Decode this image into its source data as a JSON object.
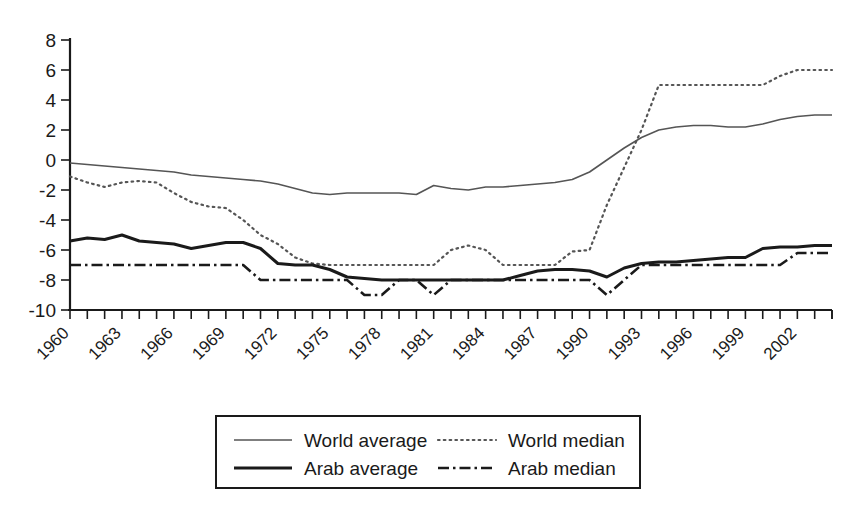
{
  "chart_data": {
    "type": "line",
    "title": "",
    "subtitle": "",
    "xlabel": "",
    "ylabel": "",
    "xlim": [
      1960,
      2004
    ],
    "ylim": [
      -10,
      8
    ],
    "ytick_step": 2,
    "grid": false,
    "legend_position": "bottom",
    "yticks": [
      "8",
      "6",
      "4",
      "2",
      "0",
      "-2",
      "-4",
      "-6",
      "-8",
      "-10"
    ],
    "ytick_values": [
      8,
      6,
      4,
      2,
      0,
      -2,
      -4,
      -6,
      -8,
      -10
    ],
    "xticks": [
      "1960",
      "1963",
      "1966",
      "1969",
      "1972",
      "1975",
      "1978",
      "1981",
      "1984",
      "1987",
      "1990",
      "1993",
      "1996",
      "1999",
      "2002"
    ],
    "xtick_values": [
      1960,
      1963,
      1966,
      1969,
      1972,
      1975,
      1978,
      1981,
      1984,
      1987,
      1990,
      1993,
      1996,
      1999,
      2002
    ],
    "x": [
      1960,
      1961,
      1962,
      1963,
      1964,
      1965,
      1966,
      1967,
      1968,
      1969,
      1970,
      1971,
      1972,
      1973,
      1974,
      1975,
      1976,
      1977,
      1978,
      1979,
      1980,
      1981,
      1982,
      1983,
      1984,
      1985,
      1986,
      1987,
      1988,
      1989,
      1990,
      1991,
      1992,
      1993,
      1994,
      1995,
      1996,
      1997,
      1998,
      1999,
      2000,
      2001,
      2002,
      2003,
      2004
    ],
    "series": [
      {
        "name": "World average",
        "style": "solid-thin",
        "color": "#555555",
        "values": [
          -0.2,
          -0.3,
          -0.4,
          -0.5,
          -0.6,
          -0.7,
          -0.8,
          -1.0,
          -1.1,
          -1.2,
          -1.3,
          -1.4,
          -1.6,
          -1.9,
          -2.2,
          -2.3,
          -2.2,
          -2.2,
          -2.2,
          -2.2,
          -2.3,
          -1.7,
          -1.9,
          -2.0,
          -1.8,
          -1.8,
          -1.7,
          -1.6,
          -1.5,
          -1.3,
          -0.8,
          0.0,
          0.8,
          1.5,
          2.0,
          2.2,
          2.3,
          2.3,
          2.2,
          2.2,
          2.4,
          2.7,
          2.9,
          3.0,
          3.0
        ]
      },
      {
        "name": "World median",
        "style": "dotted",
        "color": "#555555",
        "values": [
          -1.1,
          -1.5,
          -1.8,
          -1.5,
          -1.4,
          -1.5,
          -2.2,
          -2.8,
          -3.1,
          -3.2,
          -4.0,
          -5.0,
          -5.6,
          -6.5,
          -6.9,
          -7.0,
          -7.0,
          -7.0,
          -7.0,
          -7.0,
          -7.0,
          -7.0,
          -6.0,
          -5.7,
          -6.0,
          -7.0,
          -7.0,
          -7.0,
          -7.0,
          -6.1,
          -6.0,
          -3.0,
          -0.5,
          2.0,
          5.0,
          5.0,
          5.0,
          5.0,
          5.0,
          5.0,
          5.0,
          5.6,
          6.0,
          6.0,
          6.0
        ]
      },
      {
        "name": "Arab average",
        "style": "solid-thick",
        "color": "#1a1a1a",
        "values": [
          -5.4,
          -5.2,
          -5.3,
          -5.0,
          -5.4,
          -5.5,
          -5.6,
          -5.9,
          -5.7,
          -5.5,
          -5.5,
          -5.9,
          -6.9,
          -7.0,
          -7.0,
          -7.3,
          -7.8,
          -7.9,
          -8.0,
          -8.0,
          -8.0,
          -8.0,
          -8.0,
          -8.0,
          -8.0,
          -8.0,
          -7.7,
          -7.4,
          -7.3,
          -7.3,
          -7.4,
          -7.8,
          -7.2,
          -6.9,
          -6.8,
          -6.8,
          -6.7,
          -6.6,
          -6.5,
          -6.5,
          -5.9,
          -5.8,
          -5.8,
          -5.7,
          -5.7
        ]
      },
      {
        "name": "Arab median",
        "style": "dash-dot",
        "color": "#1a1a1a",
        "values": [
          -7.0,
          -7.0,
          -7.0,
          -7.0,
          -7.0,
          -7.0,
          -7.0,
          -7.0,
          -7.0,
          -7.0,
          -7.0,
          -8.0,
          -8.0,
          -8.0,
          -8.0,
          -8.0,
          -8.0,
          -9.0,
          -9.0,
          -8.0,
          -8.0,
          -9.0,
          -8.0,
          -8.0,
          -8.0,
          -8.0,
          -8.0,
          -8.0,
          -8.0,
          -8.0,
          -8.0,
          -9.0,
          -8.0,
          -7.0,
          -7.0,
          -7.0,
          -7.0,
          -7.0,
          -7.0,
          -7.0,
          -7.0,
          -7.0,
          -6.2,
          -6.2,
          -6.2
        ]
      }
    ]
  },
  "legend": {
    "entries": [
      {
        "label": "World average",
        "style": "solid-thin"
      },
      {
        "label": "World median",
        "style": "dotted"
      },
      {
        "label": "Arab average",
        "style": "solid-thick"
      },
      {
        "label": "Arab median",
        "style": "dash-dot"
      }
    ]
  }
}
